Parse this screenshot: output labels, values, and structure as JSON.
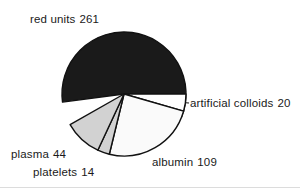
{
  "chart_data": {
    "type": "pie",
    "title": "",
    "subtitle": "",
    "xlabel": "",
    "ylabel": "",
    "legend_position": "none",
    "grid": false,
    "total": 448,
    "units": "units",
    "categories": [
      "red units",
      "artificial colloids",
      "albumin",
      "platelets",
      "plasma"
    ],
    "values": [
      261,
      20,
      109,
      14,
      44
    ],
    "slices": [
      {
        "label": "red units",
        "value": 261,
        "label_text": "red units  261",
        "name_text": "red units",
        "value_text": "261",
        "color": "#1a1a1a",
        "percent": 58.3,
        "start_angle": 172.5,
        "end_angle": 382.3
      },
      {
        "label": "artificial colloids",
        "value": 20,
        "label_text": "artificial colloids  20",
        "name_text": "artificial colloids",
        "value_text": "20",
        "color": "#ffffff",
        "percent": 4.5,
        "start_angle": 0.0,
        "end_angle": 16.1
      },
      {
        "label": "albumin",
        "value": 109,
        "label_text": "albumin  109",
        "name_text": "albumin",
        "value_text": "109",
        "color": "#fafafa",
        "percent": 24.3,
        "start_angle": 16.1,
        "end_angle": 103.7
      },
      {
        "label": "platelets",
        "value": 14,
        "label_text": "platelets  14",
        "name_text": "platelets",
        "value_text": "14",
        "color": "#d2d2d2",
        "percent": 3.1,
        "start_angle": 103.7,
        "end_angle": 115.0
      },
      {
        "label": "plasma",
        "value": 44,
        "label_text": "plasma  44",
        "name_text": "plasma",
        "value_text": "44",
        "color": "#d2d2d2",
        "percent": 9.8,
        "start_angle": 115.0,
        "end_angle": 150.4
      }
    ],
    "geometry": {
      "center_x": 124,
      "center_y": 94,
      "radius": 62
    },
    "stroke_color": "#111111",
    "background": "#ffffff"
  }
}
